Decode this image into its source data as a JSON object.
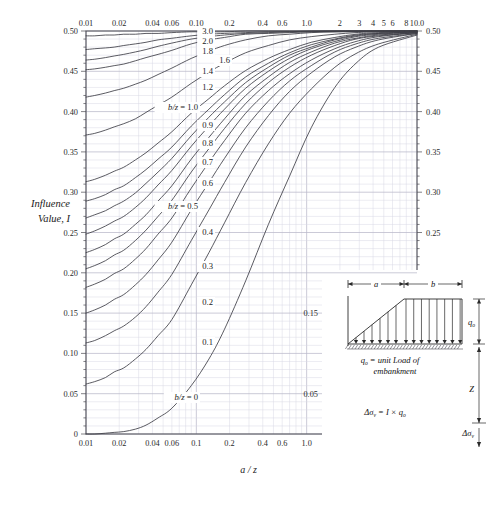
{
  "figure": {
    "ylabel_line1": "Influence",
    "ylabel_line2": "Value, I",
    "xlabel": "a / z"
  },
  "chart_data": {
    "type": "line",
    "title": "",
    "xlabel": "a / z",
    "ylabel": "Influence Value, I",
    "xscale": "log",
    "xlim": [
      0.01,
      10.0
    ],
    "ylim": [
      0,
      0.5
    ],
    "grid": true,
    "legend": "inline-curve-labels",
    "x_axis_bottom_ticks": [
      "0.01",
      "0.02",
      "0.04",
      "0.06",
      "0.1",
      "0.2",
      "0.4",
      "0.6",
      "1.0"
    ],
    "x_axis_top_ticks": [
      "0.01",
      "0.02",
      "0.04",
      "0.06",
      "0.10",
      "0.2",
      "0.4",
      "0.6",
      "1.0",
      "2",
      "3",
      "4",
      "5",
      "6",
      "8",
      "10.0"
    ],
    "x_axis_inner_ticks": [
      "2",
      "3",
      "4",
      "5",
      "6",
      "8",
      "10.0"
    ],
    "y_axis_left_ticks": [
      "0.50",
      "0.45",
      "0.40",
      "0.35",
      "0.30",
      "0.25",
      "0.20",
      "0.15",
      "0.10",
      "0.05",
      "0"
    ],
    "y_axis_right_ticks": [
      "0.50",
      "0.45",
      "0.40",
      "0.35",
      "0.30",
      "0.25",
      "0.20"
    ],
    "y_axis_right_lower_ticks": [
      "0.15",
      "0.05"
    ],
    "series_param": "b/z",
    "series": [
      {
        "name": "b/z = 0",
        "label": "b/z = 0",
        "label_prefix": "b/z =",
        "label_value": "0",
        "bz": 0.0,
        "values": [
          0.0,
          0.0,
          0.001,
          0.002,
          0.003,
          0.006,
          0.011,
          0.02,
          0.032,
          0.06,
          0.093,
          0.13,
          0.19,
          0.26,
          0.32,
          0.38,
          0.43,
          0.46,
          0.48,
          0.495
        ]
      },
      {
        "name": "0.1",
        "label": "0.1",
        "bz": 0.1,
        "values": [
          0.062,
          0.065,
          0.07,
          0.077,
          0.082,
          0.093,
          0.105,
          0.122,
          0.142,
          0.185,
          0.225,
          0.262,
          0.312,
          0.36,
          0.398,
          0.428,
          0.455,
          0.472,
          0.484,
          0.496
        ]
      },
      {
        "name": "0.2",
        "label": "0.2",
        "bz": 0.2,
        "values": [
          0.113,
          0.116,
          0.122,
          0.128,
          0.134,
          0.145,
          0.158,
          0.176,
          0.198,
          0.24,
          0.278,
          0.312,
          0.356,
          0.395,
          0.425,
          0.448,
          0.468,
          0.48,
          0.489,
          0.497
        ]
      },
      {
        "name": "0.3",
        "label": "0.3",
        "bz": 0.3,
        "values": [
          0.15,
          0.154,
          0.16,
          0.167,
          0.173,
          0.185,
          0.198,
          0.216,
          0.238,
          0.278,
          0.312,
          0.342,
          0.38,
          0.413,
          0.438,
          0.457,
          0.474,
          0.484,
          0.491,
          0.497
        ]
      },
      {
        "name": "0.4",
        "label": "0.4",
        "bz": 0.4,
        "values": [
          0.182,
          0.186,
          0.192,
          0.199,
          0.205,
          0.217,
          0.23,
          0.248,
          0.268,
          0.305,
          0.337,
          0.364,
          0.398,
          0.426,
          0.447,
          0.464,
          0.478,
          0.487,
          0.493,
          0.498
        ]
      },
      {
        "name": "b/z = 0.5",
        "label": "b/z = 0.5",
        "label_prefix": "b/z =",
        "label_value": "0.5",
        "bz": 0.5,
        "values": [
          0.205,
          0.209,
          0.215,
          0.222,
          0.228,
          0.24,
          0.253,
          0.27,
          0.29,
          0.325,
          0.354,
          0.379,
          0.41,
          0.436,
          0.455,
          0.47,
          0.482,
          0.49,
          0.494,
          0.498
        ]
      },
      {
        "name": "0.6",
        "label": "0.6",
        "bz": 0.6,
        "values": [
          0.225,
          0.229,
          0.235,
          0.242,
          0.248,
          0.26,
          0.272,
          0.289,
          0.308,
          0.341,
          0.368,
          0.391,
          0.42,
          0.443,
          0.461,
          0.474,
          0.485,
          0.491,
          0.495,
          0.498
        ]
      },
      {
        "name": "0.7",
        "label": "0.7",
        "bz": 0.7,
        "values": [
          0.248,
          0.252,
          0.258,
          0.264,
          0.27,
          0.281,
          0.293,
          0.309,
          0.327,
          0.357,
          0.382,
          0.403,
          0.429,
          0.45,
          0.466,
          0.478,
          0.487,
          0.493,
          0.496,
          0.499
        ]
      },
      {
        "name": "0.8",
        "label": "0.8",
        "bz": 0.8,
        "values": [
          0.268,
          0.272,
          0.277,
          0.283,
          0.289,
          0.299,
          0.311,
          0.325,
          0.342,
          0.37,
          0.393,
          0.412,
          0.436,
          0.455,
          0.47,
          0.48,
          0.489,
          0.494,
          0.497,
          0.499
        ]
      },
      {
        "name": "0.9",
        "label": "0.9",
        "bz": 0.9,
        "values": [
          0.289,
          0.292,
          0.297,
          0.303,
          0.308,
          0.318,
          0.328,
          0.341,
          0.356,
          0.382,
          0.403,
          0.421,
          0.443,
          0.46,
          0.473,
          0.483,
          0.49,
          0.495,
          0.497,
          0.499
        ]
      },
      {
        "name": "b/z = 1.0",
        "label": "b/z = 1.0",
        "label_prefix": "b/z =",
        "label_value": "1.0",
        "bz": 1.0,
        "values": [
          0.313,
          0.316,
          0.321,
          0.326,
          0.331,
          0.34,
          0.349,
          0.361,
          0.375,
          0.398,
          0.416,
          0.432,
          0.451,
          0.466,
          0.477,
          0.486,
          0.492,
          0.496,
          0.498,
          0.499
        ]
      },
      {
        "name": "1.2",
        "label": "1.2",
        "bz": 1.2,
        "values": [
          0.371,
          0.373,
          0.377,
          0.381,
          0.385,
          0.391,
          0.399,
          0.408,
          0.418,
          0.435,
          0.449,
          0.46,
          0.473,
          0.482,
          0.489,
          0.493,
          0.496,
          0.498,
          0.499,
          0.5
        ]
      },
      {
        "name": "1.4",
        "label": "1.4",
        "bz": 1.4,
        "values": [
          0.418,
          0.42,
          0.423,
          0.426,
          0.429,
          0.434,
          0.439,
          0.446,
          0.454,
          0.466,
          0.475,
          0.482,
          0.489,
          0.494,
          0.496,
          0.498,
          0.499,
          0.499,
          0.5,
          0.5
        ]
      },
      {
        "name": "1.6",
        "label": "1.6",
        "bz": 1.6,
        "values": [
          0.452,
          0.453,
          0.455,
          0.457,
          0.459,
          0.463,
          0.467,
          0.471,
          0.476,
          0.484,
          0.489,
          0.492,
          0.496,
          0.497,
          0.498,
          0.499,
          0.499,
          0.5,
          0.5,
          0.5
        ]
      },
      {
        "name": "1.8",
        "label": "1.8",
        "bz": 1.8,
        "values": [
          0.464,
          0.465,
          0.467,
          0.469,
          0.471,
          0.474,
          0.477,
          0.481,
          0.485,
          0.49,
          0.493,
          0.495,
          0.497,
          0.498,
          0.499,
          0.499,
          0.5,
          0.5,
          0.5,
          0.5
        ]
      },
      {
        "name": "2.0",
        "label": "2.0",
        "bz": 2.0,
        "values": [
          0.477,
          0.478,
          0.479,
          0.48,
          0.482,
          0.484,
          0.486,
          0.489,
          0.491,
          0.494,
          0.496,
          0.497,
          0.498,
          0.499,
          0.499,
          0.5,
          0.5,
          0.5,
          0.5,
          0.5
        ]
      },
      {
        "name": "3.0",
        "label": "3.0",
        "bz": 3.0,
        "values": [
          0.494,
          0.494,
          0.495,
          0.495,
          0.496,
          0.496,
          0.497,
          0.497,
          0.498,
          0.499,
          0.499,
          0.499,
          0.5,
          0.5,
          0.5,
          0.5,
          0.5,
          0.5,
          0.5,
          0.5
        ]
      }
    ],
    "x_samples": [
      0.01,
      0.012,
      0.015,
      0.018,
      0.022,
      0.028,
      0.035,
      0.045,
      0.06,
      0.09,
      0.13,
      0.18,
      0.28,
      0.45,
      0.7,
      1.1,
      1.8,
      2.8,
      4.5,
      10.0
    ]
  },
  "inset": {
    "dim_a": "a",
    "dim_b": "b",
    "load_label": "q",
    "load_sub": "o",
    "caption_line1_a": "q",
    "caption_line1_sub": "o",
    "caption_line1_b": " = unit Load of",
    "caption_line2": "embankment",
    "depth_label": "Z",
    "stress_label": "Δσ",
    "stress_sub": "v",
    "formula": "Δσ",
    "formula_sub": "v",
    "formula_rest": " = I × q",
    "formula_rest_sub": "o"
  },
  "colors": {
    "grid_minor": "#d9d8e4",
    "grid_major": "#b9b8c9",
    "curve": "#3d3d46",
    "axis": "#4a4a52",
    "text": "#1a1a1a",
    "background": "#ffffff"
  }
}
